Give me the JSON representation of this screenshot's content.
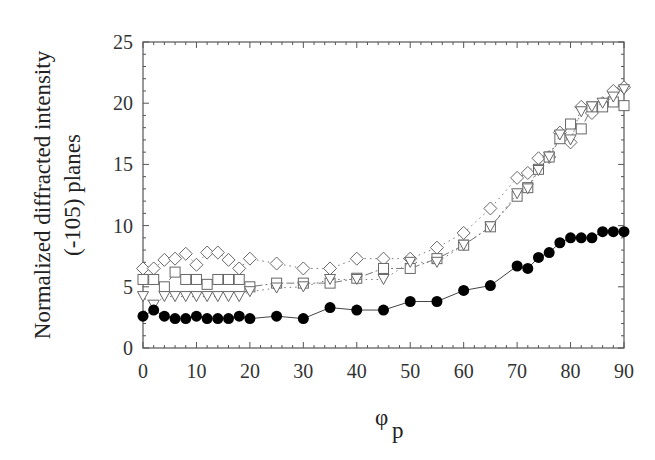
{
  "chart_data": {
    "type": "line",
    "title": "",
    "xlabel": "φ_p",
    "xlabel_main": "φ",
    "xlabel_sub": "p",
    "ylabel": "Normalized diffracted intensity (-105) planes",
    "ylabel_line1": "Normalized diffracted intensity",
    "ylabel_line2": "(-105) planes",
    "xlim": [
      0,
      90
    ],
    "ylim": [
      0,
      25
    ],
    "xticks": [
      0,
      10,
      20,
      30,
      40,
      50,
      60,
      70,
      80,
      90
    ],
    "yticks": [
      0,
      5,
      10,
      15,
      20,
      25
    ],
    "grid": false,
    "legend": null,
    "series": [
      {
        "name": "diamonds",
        "marker": "diamond-open",
        "line": "dotted",
        "x": [
          0,
          2,
          4,
          6,
          8,
          10,
          12,
          14,
          16,
          18,
          20,
          25,
          30,
          35,
          40,
          45,
          50,
          55,
          60,
          65,
          70,
          72,
          74,
          76,
          78,
          80,
          82,
          84,
          86,
          88,
          90
        ],
        "values": [
          6.5,
          6.5,
          7.2,
          7.3,
          7.7,
          6.8,
          7.8,
          7.8,
          7.2,
          6.5,
          7.3,
          6.9,
          6.5,
          6.5,
          7.3,
          7.3,
          7.3,
          8.2,
          9.4,
          11.4,
          13.9,
          14.3,
          15.5,
          15.6,
          17.6,
          16.8,
          19.7,
          19.2,
          20.0,
          21.0,
          21.3
        ]
      },
      {
        "name": "squares",
        "marker": "square-open",
        "line": "dash-dot",
        "x": [
          0,
          2,
          4,
          6,
          8,
          10,
          12,
          14,
          16,
          18,
          20,
          25,
          30,
          35,
          40,
          45,
          50,
          55,
          60,
          65,
          70,
          72,
          74,
          76,
          78,
          80,
          82,
          84,
          86,
          88,
          90
        ],
        "values": [
          5.6,
          5.6,
          5.0,
          6.2,
          5.6,
          5.6,
          5.2,
          5.6,
          5.6,
          5.6,
          5.0,
          5.3,
          5.3,
          5.3,
          5.7,
          6.5,
          6.5,
          7.3,
          8.4,
          9.9,
          12.4,
          13.1,
          14.6,
          15.6,
          17.1,
          18.3,
          17.9,
          19.7,
          19.7,
          20.1,
          19.8
        ]
      },
      {
        "name": "triangles",
        "marker": "triangle-down-open",
        "line": "dotted",
        "x": [
          0,
          2,
          4,
          6,
          8,
          10,
          12,
          14,
          16,
          18,
          20,
          25,
          30,
          35,
          40,
          45,
          50,
          55,
          60,
          65,
          70,
          72,
          74,
          76,
          78,
          80,
          82,
          84,
          86,
          88,
          90
        ],
        "values": [
          4.2,
          3.5,
          4.2,
          4.2,
          4.2,
          4.2,
          4.2,
          4.2,
          4.2,
          4.2,
          4.6,
          4.9,
          5.0,
          5.6,
          5.6,
          5.6,
          7.0,
          7.0,
          8.4,
          9.9,
          12.6,
          13.0,
          14.5,
          15.6,
          17.4,
          17.0,
          19.3,
          19.7,
          20.0,
          20.5,
          21.1
        ]
      },
      {
        "name": "filled-circles",
        "marker": "circle-filled",
        "line": "solid",
        "x": [
          0,
          2,
          4,
          6,
          8,
          10,
          12,
          14,
          16,
          18,
          20,
          25,
          30,
          35,
          40,
          45,
          50,
          55,
          60,
          65,
          70,
          72,
          74,
          76,
          78,
          80,
          82,
          84,
          86,
          88,
          90
        ],
        "values": [
          2.6,
          3.1,
          2.6,
          2.4,
          2.4,
          2.6,
          2.4,
          2.4,
          2.4,
          2.6,
          2.4,
          2.6,
          2.4,
          3.3,
          3.1,
          3.1,
          3.8,
          3.8,
          4.7,
          5.1,
          6.7,
          6.5,
          7.4,
          7.8,
          8.6,
          9.0,
          9.0,
          9.0,
          9.5,
          9.5,
          9.5
        ]
      }
    ]
  },
  "colors": {
    "axis": "#555555",
    "marker_stroke": "#666666",
    "filled_marker": "#000000",
    "background": "#ffffff"
  }
}
